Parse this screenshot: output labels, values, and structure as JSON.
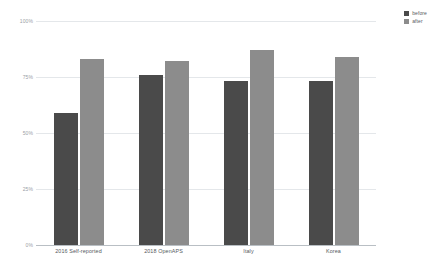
{
  "chart_data": {
    "type": "bar",
    "title": "",
    "subtitle": "",
    "xlabel": "",
    "ylabel": "",
    "ylim": [
      0,
      100
    ],
    "grid": true,
    "legend_position": "top-right",
    "categories": [
      "2016 Self-reported",
      "2018 OpenAPS",
      "Italy",
      "Korea"
    ],
    "ytick_labels": [
      "100%",
      "75%",
      "50%",
      "25%",
      "0%"
    ],
    "ytick_values": [
      100,
      75,
      50,
      25,
      0
    ],
    "series": [
      {
        "name": "before",
        "color": "#4a4a4a",
        "values": [
          59,
          76,
          73,
          73
        ]
      },
      {
        "name": "after",
        "color": "#8c8c8c",
        "values": [
          83,
          82,
          87,
          84
        ]
      }
    ]
  },
  "legend": {
    "items": [
      {
        "label": "before",
        "color": "#4a4a4a"
      },
      {
        "label": "after",
        "color": "#8c8c8c"
      }
    ]
  },
  "axes": {
    "y": {
      "ticks": [
        {
          "label": "100%",
          "value": 100
        },
        {
          "label": "75%",
          "value": 75
        },
        {
          "label": "50%",
          "value": 50
        },
        {
          "label": "25%",
          "value": 25
        },
        {
          "label": "0%",
          "value": 0
        }
      ]
    },
    "x": {
      "ticks": [
        {
          "label": "2016 Self-reported"
        },
        {
          "label": "2018 OpenAPS"
        },
        {
          "label": "Italy"
        },
        {
          "label": "Korea"
        }
      ]
    }
  },
  "colors": {
    "before": "#4a4a4a",
    "after": "#8c8c8c",
    "gridline": "#e4e7ea",
    "baseline": "#b9bfc4",
    "tick_text": "#9aa0a6",
    "category_text": "#55595e",
    "background": "#ffffff"
  }
}
